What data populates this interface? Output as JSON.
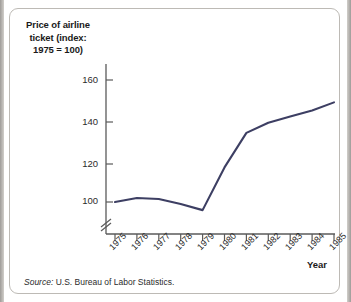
{
  "figure": {
    "source_prefix": "Source:",
    "source_text": " U.S. Bureau of Labor Statistics.",
    "axis_break_symbol": "double-slash"
  },
  "chart_data": {
    "type": "line",
    "title": "",
    "ylabel": "Price of airline ticket (index: 1975 = 100)",
    "ylabel_lines": [
      "Price of airline",
      "ticket (index:",
      "1975 = 100)"
    ],
    "xlabel": "Year",
    "categories": [
      "1975",
      "1976",
      "1977",
      "1978",
      "1979",
      "1980",
      "1981",
      "1982",
      "1983",
      "1984",
      "1985"
    ],
    "x": [
      1975,
      1976,
      1977,
      1978,
      1979,
      1980,
      1981,
      1982,
      1983,
      1984,
      1985
    ],
    "values": [
      100,
      102,
      101.5,
      99,
      96,
      117,
      134,
      139,
      142,
      145,
      149
    ],
    "series": [
      {
        "name": "Price of airline ticket (index: 1975 = 100)",
        "values": [
          100,
          102,
          101.5,
          99,
          96,
          117,
          134,
          139,
          142,
          145,
          149
        ]
      }
    ],
    "ytick_labels": [
      "160",
      "140",
      "120",
      "100"
    ],
    "yticks": [
      160,
      140,
      120,
      100
    ],
    "ylim": [
      93,
      166
    ],
    "xlim": [
      1975,
      1985
    ],
    "grid": false,
    "legend": false,
    "legend_position": "none",
    "y_axis_broken": true,
    "line_color": "#3d3f63",
    "axis_color": "#5a5a5a"
  }
}
